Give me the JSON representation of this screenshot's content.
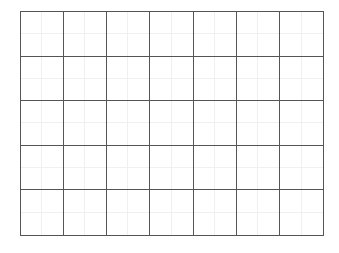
{
  "grid": {
    "columns": 7,
    "rows": 5,
    "subdivisions_per_cell": 2,
    "line_color": "#555555",
    "subline_color": "#f0f0f0",
    "background": "#ffffff",
    "cells": []
  }
}
